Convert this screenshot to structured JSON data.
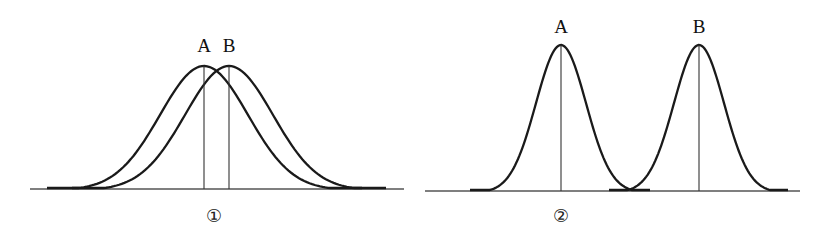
{
  "diagram": {
    "colors": {
      "stroke": "#1a1a1a",
      "axis": "#555555",
      "background": "#ffffff"
    },
    "panels": [
      {
        "id": "panel-1",
        "caption": "①",
        "note": "Curves heavily overlapping, means close together, wide spread",
        "baseline": {
          "y": 189,
          "x1": 30,
          "x2": 404
        },
        "curves": [
          {
            "label": "A",
            "mean_x": 204,
            "peak_y": 66,
            "start_x": 47,
            "end_x": 362,
            "sigma": 44
          },
          {
            "label": "B",
            "mean_x": 229,
            "peak_y": 66,
            "start_x": 72,
            "end_x": 386,
            "sigma": 44
          }
        ],
        "label_y": 52
      },
      {
        "id": "panel-2",
        "caption": "②",
        "note": "Curves barely overlapping, means far apart, narrow spread",
        "baseline": {
          "y": 191,
          "x1": 425,
          "x2": 800
        },
        "curves": [
          {
            "label": "A",
            "mean_x": 561,
            "peak_y": 45,
            "start_x": 470,
            "end_x": 650,
            "sigma": 25
          },
          {
            "label": "B",
            "mean_x": 699,
            "peak_y": 45,
            "start_x": 609,
            "end_x": 788,
            "sigma": 25
          }
        ],
        "label_y": 33
      }
    ],
    "captions": [
      {
        "text": "①",
        "x": 214,
        "y": 222
      },
      {
        "text": "②",
        "x": 561,
        "y": 222
      }
    ]
  }
}
